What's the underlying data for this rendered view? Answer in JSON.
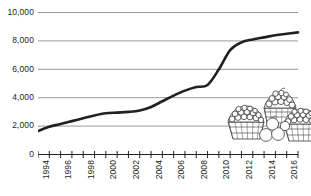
{
  "chart_data": {
    "type": "line",
    "title": "",
    "subtitle": "",
    "xlabel": "",
    "ylabel": "",
    "grid": true,
    "legend": false,
    "legend_position": "none",
    "xlim": [
      1994,
      2017
    ],
    "ylim": [
      0,
      10000
    ],
    "y_ticks": [
      0,
      2000,
      4000,
      6000,
      8000,
      10000
    ],
    "y_tick_labels": [
      "0",
      "2,000",
      "4,000",
      "6,000",
      "8,000",
      "10,000"
    ],
    "x_ticks": [
      1994,
      1995,
      1996,
      1997,
      1998,
      1999,
      2000,
      2001,
      2002,
      2003,
      2004,
      2005,
      2006,
      2007,
      2008,
      2009,
      2010,
      2011,
      2012,
      2013,
      2014,
      2015,
      2016,
      2017
    ],
    "x_tick_labels": [
      "1994",
      "1996",
      "1998",
      "2000",
      "2002",
      "2004",
      "2006",
      "2008",
      "2010",
      "2012",
      "2014",
      "2016"
    ],
    "x_labeled_years": [
      1994,
      1996,
      1998,
      2000,
      2002,
      2004,
      2006,
      2008,
      2010,
      2012,
      2014,
      2016
    ],
    "series": [
      {
        "name": "",
        "color": "#231f20",
        "x": [
          1994,
          1995,
          1996,
          1997,
          1998,
          1999,
          2000,
          2001,
          2002,
          2003,
          2004,
          2005,
          2006,
          2007,
          2008,
          2009,
          2010,
          2011,
          2012,
          2013,
          2014,
          2015,
          2016,
          2017
        ],
        "values": [
          1650,
          1950,
          2150,
          2350,
          2550,
          2750,
          2900,
          2950,
          3000,
          3100,
          3350,
          3750,
          4150,
          4500,
          4750,
          4900,
          6000,
          7350,
          7900,
          8100,
          8250,
          8400,
          8500,
          8600
        ]
      }
    ],
    "annotations": [
      {
        "name": "fruit-baskets-illustration",
        "type": "decorative-image",
        "description": "Line-art drawing of three woven baskets filled with berries and round fruit, plus loose fruit in front",
        "x_range": [
          2009,
          2016
        ],
        "y_range": [
          1700,
          4600
        ]
      }
    ]
  },
  "axes": {
    "y_labels": [
      "10,000",
      "8,000",
      "6,000",
      "4,000",
      "2,000",
      "0"
    ],
    "x_labels": [
      "1994",
      "1996",
      "1998",
      "2000",
      "2002",
      "2004",
      "2006",
      "2008",
      "2010",
      "2012",
      "2014",
      "2016"
    ]
  },
  "colors": {
    "line": "#231f20",
    "grid": "#8d8d8d",
    "axis": "#231f20",
    "text": "#231f20",
    "background": "#ffffff",
    "illustration": "#3a3a3a"
  },
  "illustration": {
    "name": "fruit-baskets-icon",
    "label": "fruit baskets"
  }
}
